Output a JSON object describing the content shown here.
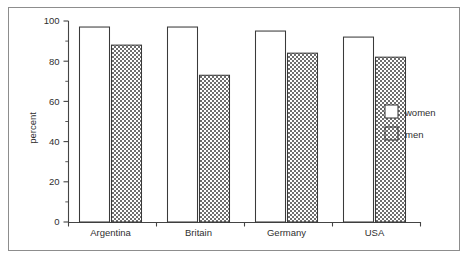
{
  "chart_data": {
    "type": "bar",
    "title": "",
    "subtitle": "",
    "xlabel": "",
    "ylabel": "percent",
    "categories": [
      "Argentina",
      "Britain",
      "Germany",
      "USA"
    ],
    "series": [
      {
        "name": "women",
        "values": [
          97,
          97,
          95,
          92
        ],
        "fill": "white"
      },
      {
        "name": "men",
        "values": [
          88,
          73,
          84,
          82
        ],
        "fill": "dotted"
      }
    ],
    "ylim": [
      0,
      100
    ],
    "ytick_labels": [
      "0",
      "20",
      "40",
      "60",
      "80",
      "100"
    ],
    "ytick_values": [
      0,
      20,
      40,
      60,
      80,
      100
    ],
    "yminor_values": [
      10,
      30,
      50,
      70,
      90
    ],
    "grid": false,
    "legend_position": "right",
    "legend_entries": [
      "women",
      "men"
    ],
    "border": true
  },
  "axis": {
    "y_title": "percent"
  },
  "legend": {
    "items": [
      {
        "label": "women"
      },
      {
        "label": "men"
      }
    ]
  }
}
